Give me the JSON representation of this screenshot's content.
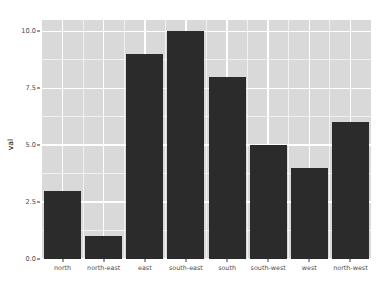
{
  "chart_data": {
    "type": "bar",
    "title": "",
    "subtitle": "",
    "xlabel": "",
    "ylabel": "val",
    "categories": [
      "north",
      "north-east",
      "east",
      "south-east",
      "south",
      "south-west",
      "west",
      "north-west"
    ],
    "values": [
      3,
      1,
      9,
      10,
      8,
      5,
      4,
      6
    ],
    "series": [
      {
        "name": "val",
        "values": [
          3,
          1,
          9,
          10,
          8,
          5,
          4,
          6
        ]
      }
    ],
    "ylim": [
      0,
      10.5
    ],
    "y_ticks": [
      0.0,
      2.5,
      5.0,
      7.5,
      10.0
    ],
    "y_tick_labels": [
      "0.0",
      "2.5",
      "5.0",
      "7.5",
      "10.0"
    ],
    "y_minor_ticks": [
      1.25,
      3.75,
      6.25,
      8.75
    ],
    "grid": true,
    "grid_color": "#ffffff",
    "legend": false,
    "legend_position": "none",
    "bar_color": "#2b2b2b",
    "panel_background": "#d9d9d9",
    "figure_background": "#ffffff",
    "bar_width_fraction": 0.9,
    "annotations": []
  }
}
